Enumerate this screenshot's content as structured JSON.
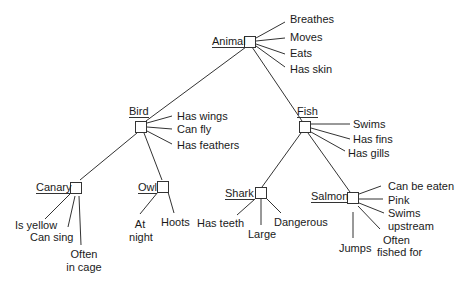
{
  "diagram": {
    "title": "",
    "type": "semantic-network",
    "nodes": {
      "animal": {
        "label": "Animal",
        "properties": [
          "Breathes",
          "Moves",
          "Eats",
          "Has skin"
        ]
      },
      "bird": {
        "label": "Bird",
        "properties": [
          "Has wings",
          "Can fly",
          "Has feathers"
        ]
      },
      "fish": {
        "label": "Fish",
        "properties": [
          "Swims",
          "Has fins",
          "Has gills"
        ]
      },
      "canary": {
        "label": "Canary",
        "properties": [
          "Is yellow",
          "Can sing",
          "Often",
          "in cage"
        ]
      },
      "owl": {
        "label": "Owl",
        "properties": [
          "At",
          "night",
          "Hoots"
        ]
      },
      "shark": {
        "label": "Shark",
        "properties": [
          "Has teeth",
          "Large",
          "Dangerous"
        ]
      },
      "salmon": {
        "label": "Salmon",
        "properties": [
          "Can be eaten",
          "Pink",
          "Swims",
          "upstream",
          "Jumps",
          "Often",
          "fished for"
        ]
      }
    },
    "edges": [
      [
        "Animal",
        "Bird"
      ],
      [
        "Animal",
        "Fish"
      ],
      [
        "Bird",
        "Canary"
      ],
      [
        "Bird",
        "Owl"
      ],
      [
        "Fish",
        "Shark"
      ],
      [
        "Fish",
        "Salmon"
      ]
    ],
    "line_color": "#333333"
  }
}
